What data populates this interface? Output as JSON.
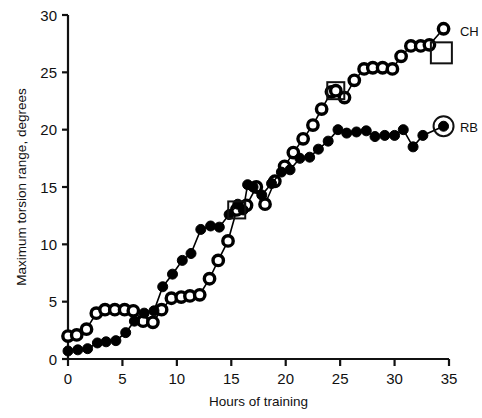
{
  "chart_data": {
    "type": "line",
    "title": "",
    "xlabel": "Hours of training",
    "ylabel": "Maximum torsion range, degrees",
    "xlim": [
      0,
      35
    ],
    "ylim": [
      0,
      30
    ],
    "xticks": [
      0,
      5,
      10,
      15,
      20,
      25,
      30,
      35
    ],
    "yticks": [
      0,
      5,
      10,
      15,
      20,
      25,
      30
    ],
    "grid": false,
    "legend_position": "right-inline",
    "series": [
      {
        "name": "CH",
        "marker": "open-circle",
        "color": "#000000",
        "points": [
          [
            0.0,
            2.0
          ],
          [
            0.8,
            2.1
          ],
          [
            1.7,
            2.6
          ],
          [
            2.6,
            4.0
          ],
          [
            3.4,
            4.3
          ],
          [
            4.3,
            4.3
          ],
          [
            5.2,
            4.3
          ],
          [
            6.0,
            4.2
          ],
          [
            6.9,
            3.3
          ],
          [
            7.8,
            3.2
          ],
          [
            8.6,
            4.3
          ],
          [
            9.5,
            5.3
          ],
          [
            10.4,
            5.4
          ],
          [
            11.2,
            5.5
          ],
          [
            12.1,
            5.6
          ],
          [
            13.0,
            7.0
          ],
          [
            13.8,
            8.6
          ],
          [
            14.7,
            10.3
          ],
          [
            15.5,
            13.0
          ],
          [
            16.4,
            13.4
          ],
          [
            17.3,
            15.0
          ],
          [
            18.1,
            13.5
          ],
          [
            19.0,
            15.5
          ],
          [
            19.9,
            16.8
          ],
          [
            20.7,
            18.0
          ],
          [
            21.6,
            19.2
          ],
          [
            22.5,
            20.4
          ],
          [
            23.3,
            21.8
          ],
          [
            24.2,
            23.3
          ],
          [
            24.6,
            23.4
          ],
          [
            25.4,
            22.8
          ],
          [
            26.3,
            24.3
          ],
          [
            27.2,
            25.3
          ],
          [
            28.0,
            25.4
          ],
          [
            28.9,
            25.4
          ],
          [
            29.8,
            25.3
          ],
          [
            30.6,
            26.4
          ],
          [
            31.5,
            27.3
          ],
          [
            32.4,
            27.3
          ],
          [
            33.2,
            27.4
          ],
          [
            34.5,
            28.8
          ]
        ]
      },
      {
        "name": "RB",
        "marker": "filled-circle",
        "color": "#000000",
        "points": [
          [
            0.0,
            0.7
          ],
          [
            0.9,
            0.8
          ],
          [
            1.8,
            0.9
          ],
          [
            2.7,
            1.4
          ],
          [
            3.5,
            1.5
          ],
          [
            4.4,
            1.6
          ],
          [
            5.3,
            2.3
          ],
          [
            6.1,
            3.3
          ],
          [
            7.0,
            4.0
          ],
          [
            7.9,
            4.2
          ],
          [
            8.7,
            6.3
          ],
          [
            9.6,
            7.4
          ],
          [
            10.5,
            8.6
          ],
          [
            11.3,
            9.2
          ],
          [
            12.2,
            11.3
          ],
          [
            13.1,
            11.6
          ],
          [
            13.9,
            11.5
          ],
          [
            14.8,
            12.6
          ],
          [
            15.6,
            13.5
          ],
          [
            16.1,
            13.0
          ],
          [
            16.5,
            15.2
          ],
          [
            17.0,
            15.0
          ],
          [
            17.8,
            14.3
          ],
          [
            18.7,
            15.3
          ],
          [
            19.6,
            16.3
          ],
          [
            20.4,
            16.5
          ],
          [
            21.3,
            17.5
          ],
          [
            22.2,
            17.6
          ],
          [
            23.0,
            18.3
          ],
          [
            23.9,
            19.0
          ],
          [
            24.8,
            20.0
          ],
          [
            25.6,
            19.7
          ],
          [
            26.5,
            19.8
          ],
          [
            27.4,
            19.9
          ],
          [
            28.2,
            19.4
          ],
          [
            29.1,
            19.5
          ],
          [
            30.0,
            19.5
          ],
          [
            30.8,
            20.0
          ],
          [
            31.7,
            18.5
          ],
          [
            32.6,
            19.5
          ],
          [
            34.5,
            20.3
          ]
        ]
      }
    ],
    "annotations": [
      {
        "name": "square-highlight-ch-1",
        "series": "CH",
        "x": 15.5,
        "y": 13.0,
        "shape": "square-outline"
      },
      {
        "name": "square-highlight-ch-2",
        "series": "CH",
        "x": 24.6,
        "y": 23.4,
        "shape": "square-outline"
      },
      {
        "name": "legend-key-ch",
        "x": 34.3,
        "y": 26.7,
        "shape": "square-outline"
      },
      {
        "name": "legend-key-rb",
        "x": 34.5,
        "y": 20.3,
        "shape": "circle-outline"
      }
    ],
    "series_labels": [
      {
        "text": "CH",
        "x": 36.0,
        "y": 28.6
      },
      {
        "text": "RB",
        "x": 36.0,
        "y": 20.2
      }
    ]
  }
}
